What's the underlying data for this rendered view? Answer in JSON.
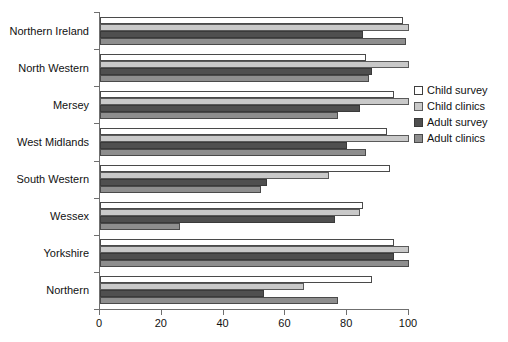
{
  "chart_data": {
    "type": "bar",
    "orientation": "horizontal",
    "title": "",
    "xlabel": "",
    "ylabel": "",
    "xlim": [
      0,
      100
    ],
    "xticks": [
      0,
      20,
      40,
      60,
      80,
      100
    ],
    "grid": false,
    "legend_position": "right",
    "categories": [
      "Northern Ireland",
      "North Western",
      "Mersey",
      "West Midlands",
      "South Western",
      "Wessex",
      "Yorkshire",
      "Northern"
    ],
    "series": [
      {
        "name": "Child survey",
        "color": "#ffffff",
        "values": [
          98,
          86,
          95,
          93,
          94,
          85,
          95,
          88
        ]
      },
      {
        "name": "Child clinics",
        "color": "#c9c9c9",
        "values": [
          100,
          100,
          100,
          100,
          74,
          84,
          100,
          66
        ]
      },
      {
        "name": "Adult survey",
        "color": "#4f4f4f",
        "values": [
          85,
          88,
          84,
          80,
          54,
          76,
          95,
          53
        ]
      },
      {
        "name": "Adult clinics",
        "color": "#8e8e8e",
        "values": [
          99,
          87,
          77,
          86,
          52,
          26,
          100,
          77
        ]
      }
    ]
  },
  "legend": {
    "items": [
      {
        "label": "Child survey"
      },
      {
        "label": "Child clinics"
      },
      {
        "label": "Adult survey"
      },
      {
        "label": "Adult clinics"
      }
    ]
  }
}
